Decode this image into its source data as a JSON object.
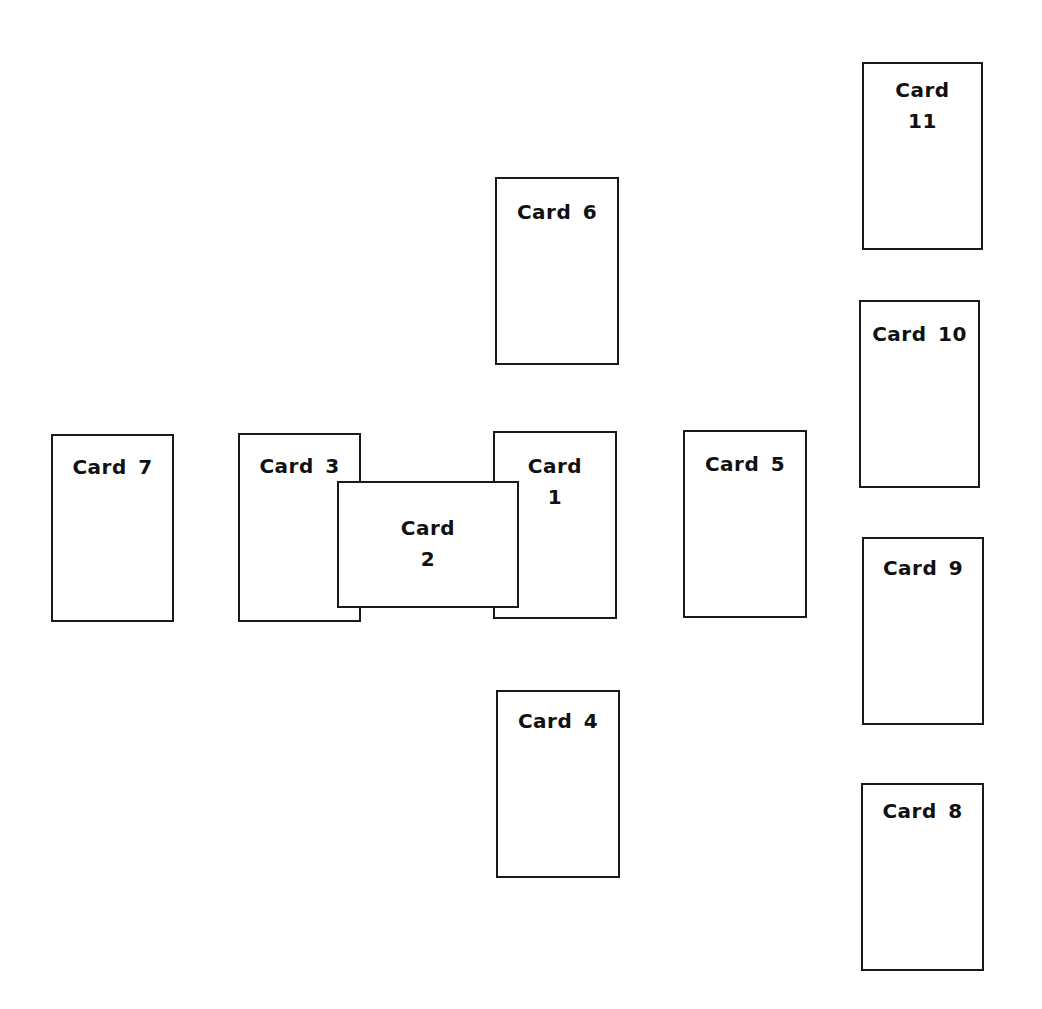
{
  "diagram": {
    "border_color": "#1a1a1a",
    "background": "#ffffff",
    "cards": [
      {
        "id": 1,
        "label": "Card\n1",
        "left": 493,
        "top": 431,
        "width": 124,
        "height": 188,
        "label_top": 18
      },
      {
        "id": 2,
        "label": "Card\n2",
        "left": 337,
        "top": 481,
        "width": 182,
        "height": 127,
        "label_top": 30
      },
      {
        "id": 3,
        "label": "Card 3",
        "left": 238,
        "top": 433,
        "width": 123,
        "height": 189,
        "label_top": 16
      },
      {
        "id": 4,
        "label": "Card 4",
        "left": 496,
        "top": 690,
        "width": 124,
        "height": 188,
        "label_top": 14
      },
      {
        "id": 5,
        "label": "Card 5",
        "left": 683,
        "top": 430,
        "width": 124,
        "height": 188,
        "label_top": 17
      },
      {
        "id": 6,
        "label": "Card 6",
        "left": 495,
        "top": 177,
        "width": 124,
        "height": 188,
        "label_top": 18
      },
      {
        "id": 7,
        "label": "Card 7",
        "left": 51,
        "top": 434,
        "width": 123,
        "height": 188,
        "label_top": 16
      },
      {
        "id": 8,
        "label": "Card 8",
        "left": 861,
        "top": 783,
        "width": 123,
        "height": 188,
        "label_top": 11
      },
      {
        "id": 9,
        "label": "Card 9",
        "left": 862,
        "top": 537,
        "width": 122,
        "height": 188,
        "label_top": 14
      },
      {
        "id": 10,
        "label": "Card 10",
        "left": 859,
        "top": 300,
        "width": 121,
        "height": 188,
        "label_top": 17
      },
      {
        "id": 11,
        "label": "Card\n11",
        "left": 862,
        "top": 62,
        "width": 121,
        "height": 188,
        "label_top": 11
      }
    ]
  }
}
